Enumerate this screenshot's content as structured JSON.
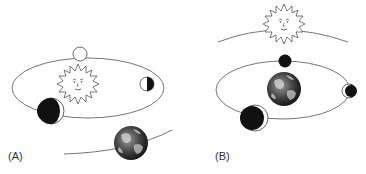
{
  "panels": [
    {
      "id": "A",
      "label": "(A)",
      "model": "heliocentric",
      "center_body": "sun",
      "orbiting_body": "earth"
    },
    {
      "id": "B",
      "label": "(B)",
      "model": "geocentric",
      "center_body": "earth",
      "orbiting_body": "sun"
    }
  ],
  "colors": {
    "line": "#555555",
    "dark": "#111111",
    "light": "#ffffff",
    "earth_ocean": "#2b2b2b",
    "earth_land": "#8a8a8a"
  },
  "icons": {
    "sun": "sun-face-icon",
    "earth": "earth-globe-icon",
    "moon": "moon-phase-icon"
  }
}
